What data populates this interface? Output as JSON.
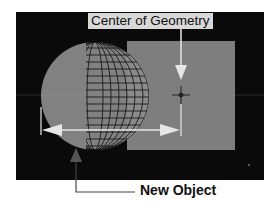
{
  "labels": {
    "center_of_geometry": "Center of Geometry",
    "new_object": "New Object"
  },
  "colors": {
    "viewport_bg": "#0a0a0a",
    "object_gray": "#8a8a8a",
    "arrow_white": "#e6e6e6",
    "callout_bg": "#d8d8d8"
  }
}
